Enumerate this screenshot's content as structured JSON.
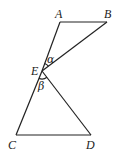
{
  "diagram": {
    "points": {
      "A": {
        "label": "A",
        "x": 60,
        "y": 22
      },
      "B": {
        "label": "B",
        "x": 107,
        "y": 22
      },
      "E": {
        "label": "E",
        "x": 42,
        "y": 71
      },
      "C": {
        "label": "C",
        "x": 16,
        "y": 135
      },
      "D": {
        "label": "D",
        "x": 91,
        "y": 135
      }
    },
    "segments": [
      "AB",
      "AE",
      "EB",
      "EC",
      "ED",
      "CD"
    ],
    "angles": {
      "alpha": {
        "label": "α",
        "vertex": "E",
        "between": [
          "A",
          "B"
        ]
      },
      "beta": {
        "label": "β",
        "vertex": "E",
        "between": [
          "C",
          "D"
        ]
      }
    },
    "stroke_color": "#222222"
  }
}
